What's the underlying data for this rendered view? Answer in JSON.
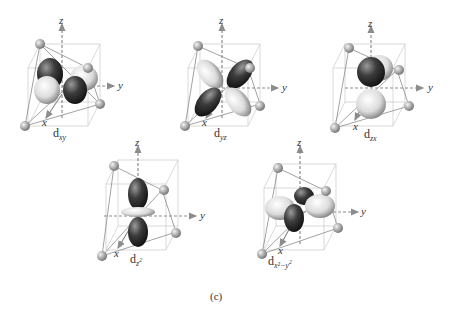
{
  "figure": {
    "caption": "(c)",
    "axis_labels": {
      "x": "x",
      "y": "y",
      "z": "z"
    },
    "colors": {
      "cube_line": "#c8c8c8",
      "tetra_line": "#8a8a8a",
      "axis": "#8c8c8c",
      "sphere": "#a9a9a9",
      "lobe_dark": "#3a3a3a",
      "lobe_light": "#e6e6e6"
    },
    "panels": [
      {
        "id": "dxy",
        "label_main": "d",
        "label_sub": "xy",
        "label_sup": ""
      },
      {
        "id": "dyz",
        "label_main": "d",
        "label_sub": "yz",
        "label_sup": ""
      },
      {
        "id": "dzx",
        "label_main": "d",
        "label_sub": "zx",
        "label_sup": ""
      },
      {
        "id": "dz2",
        "label_main": "d",
        "label_sub": "z",
        "label_sup": "2"
      },
      {
        "id": "dx2y2",
        "label_main": "d",
        "label_sub": "x²−y",
        "label_sup": "2"
      }
    ]
  }
}
